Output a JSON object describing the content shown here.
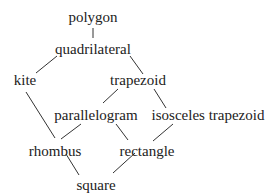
{
  "diagram": {
    "type": "hasse-diagram",
    "nodes": [
      {
        "id": "polygon",
        "label": "polygon",
        "x": 93,
        "y": 22
      },
      {
        "id": "quadrilateral",
        "label": "quadrilateral",
        "x": 93,
        "y": 54
      },
      {
        "id": "kite",
        "label": "kite",
        "x": 25,
        "y": 85
      },
      {
        "id": "trapezoid",
        "label": "trapezoid",
        "x": 138,
        "y": 85
      },
      {
        "id": "parallelogram",
        "label": "parallelogram",
        "x": 96,
        "y": 120
      },
      {
        "id": "isosceles_trapezoid",
        "label": "isosceles trapezoid",
        "x": 208,
        "y": 120
      },
      {
        "id": "rhombus",
        "label": "rhombus",
        "x": 55,
        "y": 156
      },
      {
        "id": "rectangle",
        "label": "rectangle",
        "x": 147,
        "y": 156
      },
      {
        "id": "square",
        "label": "square",
        "x": 96,
        "y": 190
      }
    ],
    "edges": [
      {
        "from": "polygon",
        "to": "quadrilateral"
      },
      {
        "from": "quadrilateral",
        "to": "kite"
      },
      {
        "from": "quadrilateral",
        "to": "trapezoid"
      },
      {
        "from": "kite",
        "to": "rhombus"
      },
      {
        "from": "trapezoid",
        "to": "parallelogram"
      },
      {
        "from": "trapezoid",
        "to": "isosceles_trapezoid"
      },
      {
        "from": "parallelogram",
        "to": "rhombus"
      },
      {
        "from": "parallelogram",
        "to": "rectangle"
      },
      {
        "from": "isosceles_trapezoid",
        "to": "rectangle"
      },
      {
        "from": "rhombus",
        "to": "square"
      },
      {
        "from": "rectangle",
        "to": "square"
      }
    ]
  }
}
